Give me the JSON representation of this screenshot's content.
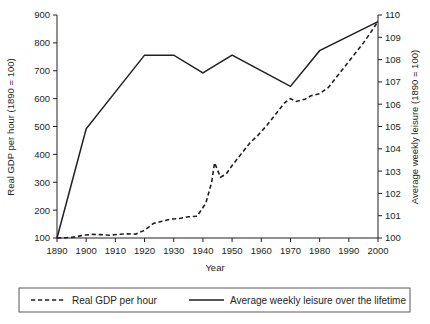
{
  "chart_data": {
    "type": "line",
    "title": "",
    "xlabel": "Year",
    "ylabel": "Real GDP per hour (1890 = 100)",
    "y2label": "Average weekly leisure (1890 = 100)",
    "grid": false,
    "legend_position": "bottom",
    "xlim": [
      1890,
      2000
    ],
    "ylim": [
      100,
      900
    ],
    "y2lim": [
      100,
      110
    ],
    "xticks": [
      1890,
      1900,
      1910,
      1920,
      1930,
      1940,
      1950,
      1960,
      1970,
      1980,
      1990,
      2000
    ],
    "xtick_labels": [
      "1890",
      "1900",
      "1910",
      "1920",
      "1930",
      "1940",
      "1950",
      "1960",
      "1970",
      "1980",
      "1990",
      "2000"
    ],
    "yticks": [
      100,
      200,
      300,
      400,
      500,
      600,
      700,
      800,
      900
    ],
    "ytick_labels": [
      "100",
      "200",
      "300",
      "400",
      "500",
      "600",
      "700",
      "800",
      "900"
    ],
    "y2ticks": [
      100,
      101,
      102,
      103,
      104,
      105,
      106,
      107,
      108,
      109,
      110
    ],
    "y2tick_labels": [
      "100",
      "101",
      "102",
      "103",
      "104",
      "105",
      "106",
      "107",
      "108",
      "109",
      "110"
    ],
    "series": [
      {
        "name": "Real GDP per hour",
        "axis": "left",
        "style": "dashed",
        "color": "#231f20",
        "x": [
          1890,
          1893,
          1896,
          1899,
          1902,
          1905,
          1908,
          1911,
          1914,
          1917,
          1920,
          1923,
          1926,
          1929,
          1932,
          1935,
          1938,
          1941,
          1943,
          1944,
          1946,
          1948,
          1950,
          1953,
          1956,
          1959,
          1962,
          1965,
          1968,
          1970,
          1972,
          1975,
          1977,
          1980,
          1983,
          1986,
          1989,
          1992,
          1995,
          1998,
          2000
        ],
        "values": [
          100,
          101,
          103,
          110,
          113,
          112,
          110,
          113,
          115,
          114,
          128,
          152,
          160,
          168,
          170,
          176,
          178,
          225,
          300,
          370,
          318,
          330,
          360,
          400,
          440,
          470,
          505,
          545,
          585,
          600,
          590,
          598,
          610,
          618,
          640,
          680,
          720,
          760,
          800,
          845,
          878
        ]
      },
      {
        "name": "Average weekly leisure over the lifetime",
        "axis": "right",
        "style": "solid",
        "color": "#231f20",
        "x": [
          1890,
          1900,
          1920,
          1930,
          1940,
          1950,
          1970,
          1980,
          2000
        ],
        "values": [
          100.0,
          104.9,
          108.2,
          108.2,
          107.4,
          108.2,
          106.8,
          108.4,
          109.7
        ]
      }
    ],
    "legend": [
      {
        "label": "Real GDP per hour",
        "style": "dashed"
      },
      {
        "label": "Average weekly leisure over the lifetime",
        "style": "solid"
      }
    ]
  }
}
